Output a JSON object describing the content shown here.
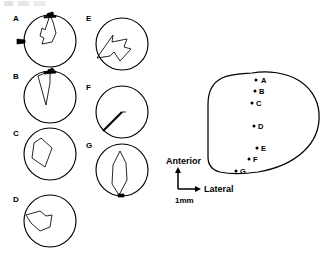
{
  "figure": {
    "type": "scientific-figure",
    "header_artifact": "cropped-text-band",
    "colors": {
      "ink": "#000000",
      "background": "#ffffff"
    }
  },
  "polar_panels": {
    "column_left": [
      "A",
      "B",
      "C",
      "D"
    ],
    "column_right": [
      "E",
      "F",
      "G"
    ],
    "panels": [
      {
        "label": "A",
        "column": "left",
        "row": 1,
        "circle": {
          "cx": 50,
          "cy": 41,
          "r": 26
        },
        "edge_markers": [
          {
            "name": "top-marker",
            "angle_deg": 90
          },
          {
            "name": "left-marker",
            "angle_deg": 180
          }
        ],
        "trace": "narrow-hooked-polygon",
        "trace_points": "50,15 45,30 42,28 40,36 44,38 42,44 52,42 56,33 53,22"
      },
      {
        "label": "B",
        "column": "left",
        "row": 2,
        "circle": {
          "cx": 50,
          "cy": 97,
          "r": 26
        },
        "edge_markers": [
          {
            "name": "top-marker",
            "angle_deg": 90
          }
        ],
        "trace": "narrow-spike",
        "trace_points": "50,71 38,76 46,105 50,83"
      },
      {
        "label": "C",
        "column": "left",
        "row": 3,
        "circle": {
          "cx": 50,
          "cy": 154,
          "r": 26
        },
        "edge_markers": [],
        "trace": "quadrilateral",
        "trace_points": "34,143 32,158 45,167 52,148 41,138"
      },
      {
        "label": "D",
        "column": "left",
        "row": 4,
        "circle": {
          "cx": 50,
          "cy": 221,
          "r": 26
        },
        "edge_markers": [],
        "trace": "irregular-blob",
        "trace_points": "26,215 40,211 46,216 52,215 50,227 40,231 31,223"
      },
      {
        "label": "E",
        "column": "right",
        "row": 1,
        "circle": {
          "cx": 122,
          "cy": 44,
          "r": 26
        },
        "edge_markers": [],
        "trace": "arrow-polygon",
        "trace_points": "97,58 113,35 112,42 127,39 124,47 131,49 120,61 114,52 110,56"
      },
      {
        "label": "F",
        "column": "right",
        "row": 2,
        "circle": {
          "cx": 122,
          "cy": 112,
          "r": 26
        },
        "edge_markers": [],
        "trace": "thick-diagonal-line",
        "trace_points": "103,131 122,112"
      },
      {
        "label": "G",
        "column": "right",
        "row": 3,
        "circle": {
          "cx": 122,
          "cy": 170,
          "r": 26
        },
        "edge_markers": [
          {
            "name": "bottom-marker",
            "angle_deg": 270
          }
        ],
        "trace": "narrow-leaf",
        "trace_points": "120,151 113,165 112,184 119,195 127,180 126,163"
      }
    ]
  },
  "site_map": {
    "outline_name": "tissue-outline",
    "sites": [
      {
        "label": "A",
        "x": 261,
        "y": 80
      },
      {
        "label": "B",
        "x": 260,
        "y": 91
      },
      {
        "label": "C",
        "x": 257,
        "y": 104
      },
      {
        "label": "D",
        "x": 259,
        "y": 127
      },
      {
        "label": "E",
        "x": 262,
        "y": 149
      },
      {
        "label": "F",
        "x": 254,
        "y": 160
      },
      {
        "label": "G",
        "x": 241,
        "y": 172
      }
    ],
    "axes": {
      "anterior_label": "Anterior",
      "lateral_label": "Lateral",
      "scale_label": "1mm"
    }
  }
}
